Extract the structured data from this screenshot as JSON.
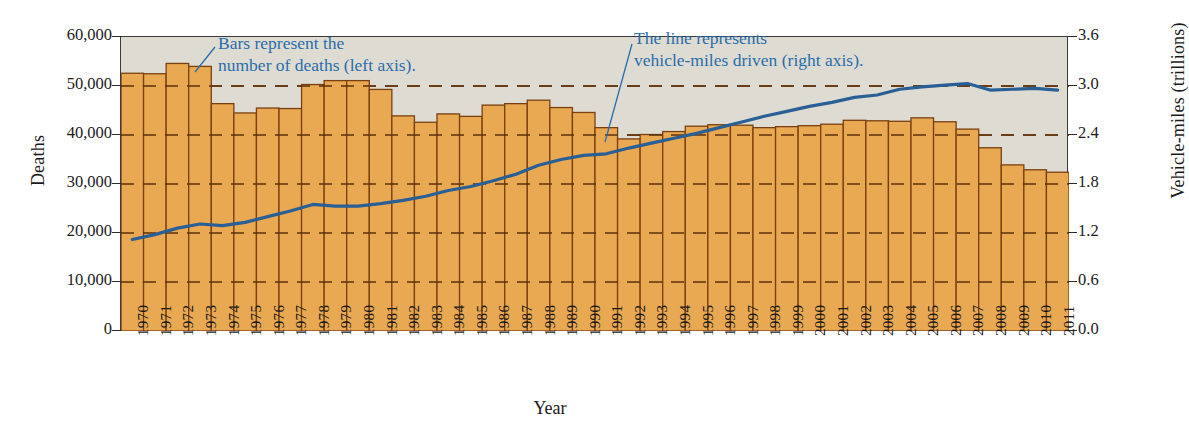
{
  "chart_data": {
    "type": "bar",
    "title": "",
    "xlabel": "Year",
    "ylabel": "Deaths",
    "y2label": "Vehicle-miles (trillions)",
    "ylim": [
      0,
      60000
    ],
    "y2lim": [
      0,
      3.6
    ],
    "grid": true,
    "legend": "none",
    "categories": [
      "1970",
      "1971",
      "1972",
      "1973",
      "1974",
      "1975",
      "1976",
      "1977",
      "1978",
      "1979",
      "1980",
      "1981",
      "1982",
      "1983",
      "1984",
      "1985",
      "1986",
      "1987",
      "1988",
      "1989",
      "1990",
      "1991",
      "1992",
      "1993",
      "1994",
      "1995",
      "1996",
      "1997",
      "1998",
      "1999",
      "2000",
      "2001",
      "2002",
      "2003",
      "2004",
      "2005",
      "2006",
      "2007",
      "2008",
      "2009",
      "2010",
      "2011"
    ],
    "y_ticks": [
      "0",
      "10,000",
      "20,000",
      "30,000",
      "40,000",
      "50,000",
      "60,000"
    ],
    "y2_ticks": [
      "0.0",
      "0.6",
      "1.2",
      "1.8",
      "2.4",
      "3.0",
      "3.6"
    ],
    "series": [
      {
        "name": "Deaths",
        "axis": "left",
        "type": "bar",
        "color": "#e8a952",
        "edge_color": "#7a3f10",
        "values": [
          52600,
          52500,
          54600,
          54000,
          46400,
          44500,
          45500,
          45400,
          50300,
          51100,
          51100,
          49300,
          43900,
          42600,
          44300,
          43800,
          46100,
          46400,
          47100,
          45600,
          44600,
          41500,
          39200,
          40100,
          40700,
          41800,
          42100,
          42000,
          41500,
          41700,
          41900,
          42200,
          43000,
          42900,
          42800,
          43500,
          42700,
          41200,
          37400,
          33900,
          32900,
          32400
        ]
      },
      {
        "name": "Vehicle-miles driven",
        "axis": "right",
        "type": "line",
        "color": "#2a5f96",
        "values": [
          1.12,
          1.18,
          1.26,
          1.31,
          1.29,
          1.33,
          1.4,
          1.47,
          1.55,
          1.53,
          1.53,
          1.56,
          1.6,
          1.65,
          1.72,
          1.77,
          1.84,
          1.92,
          2.03,
          2.1,
          2.15,
          2.17,
          2.24,
          2.3,
          2.36,
          2.42,
          2.49,
          2.56,
          2.63,
          2.69,
          2.75,
          2.8,
          2.86,
          2.89,
          2.96,
          2.99,
          3.01,
          3.03,
          2.95,
          2.96,
          2.97,
          2.95
        ]
      }
    ],
    "annotations": [
      {
        "id": "bars-note",
        "text": "Bars represent the\nnumber of deaths (left axis).",
        "color": "#2b6cab"
      },
      {
        "id": "line-note",
        "text": "The line represents\nvehicle-miles driven (right axis).",
        "color": "#2b6cab"
      }
    ]
  },
  "colors": {
    "bar_fill": "#e8a952",
    "bar_edge": "#7a3f10",
    "line": "#2a5f96",
    "plot_background": "#dedcd2",
    "grid": "#7a3f10",
    "frame": "#3a3a3a",
    "annotation": "#2b6cab"
  }
}
